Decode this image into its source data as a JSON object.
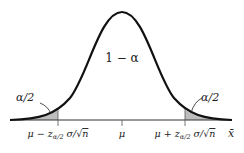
{
  "diagram": {
    "type": "normal-distribution-confidence-interval",
    "center_label": "1 − α",
    "left_tail_label": "α/2",
    "right_tail_label": "α/2",
    "axis_label": "x̄",
    "tick_labels": {
      "left": {
        "mu": "μ",
        "op": " − ",
        "z": "z",
        "sub": "α/2",
        "sigma": " σ/√",
        "n": "n"
      },
      "center": "μ",
      "right": {
        "mu": "μ",
        "op": " + ",
        "z": "z",
        "sub": "α/2",
        "sigma": " σ/√",
        "n": "n"
      }
    },
    "colors": {
      "curve": "#111111",
      "axis": "#333333",
      "tail_fill": "#bdbdbd",
      "background": "#ffffff"
    }
  }
}
